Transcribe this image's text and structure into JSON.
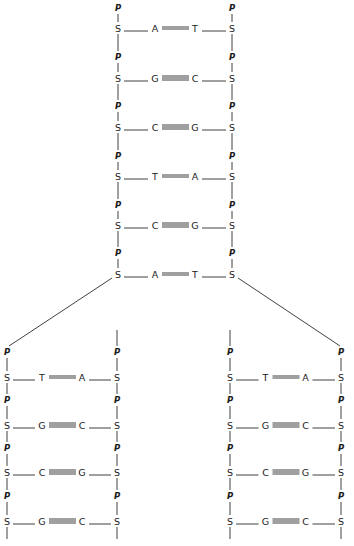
{
  "diagram": {
    "labels": {
      "phosphate": "P",
      "sugar": "S"
    },
    "parent": {
      "pairs": [
        {
          "left": "A",
          "right": "T",
          "bonds": 2
        },
        {
          "left": "G",
          "right": "C",
          "bonds": 3
        },
        {
          "left": "C",
          "right": "G",
          "bonds": 3
        },
        {
          "left": "T",
          "right": "A",
          "bonds": 2
        },
        {
          "left": "C",
          "right": "G",
          "bonds": 3
        },
        {
          "left": "A",
          "right": "T",
          "bonds": 2
        }
      ]
    },
    "daughters": [
      {
        "name": "left-daughter",
        "pairs": [
          {
            "left": "T",
            "right": "A",
            "bonds": 2
          },
          {
            "left": "G",
            "right": "C",
            "bonds": 3
          },
          {
            "left": "C",
            "right": "G",
            "bonds": 3
          },
          {
            "left": "G",
            "right": "C",
            "bonds": 3
          }
        ]
      },
      {
        "name": "right-daughter",
        "pairs": [
          {
            "left": "T",
            "right": "A",
            "bonds": 2
          },
          {
            "left": "G",
            "right": "C",
            "bonds": 3
          },
          {
            "left": "C",
            "right": "G",
            "bonds": 3
          },
          {
            "left": "G",
            "right": "C",
            "bonds": 3
          }
        ]
      }
    ]
  }
}
